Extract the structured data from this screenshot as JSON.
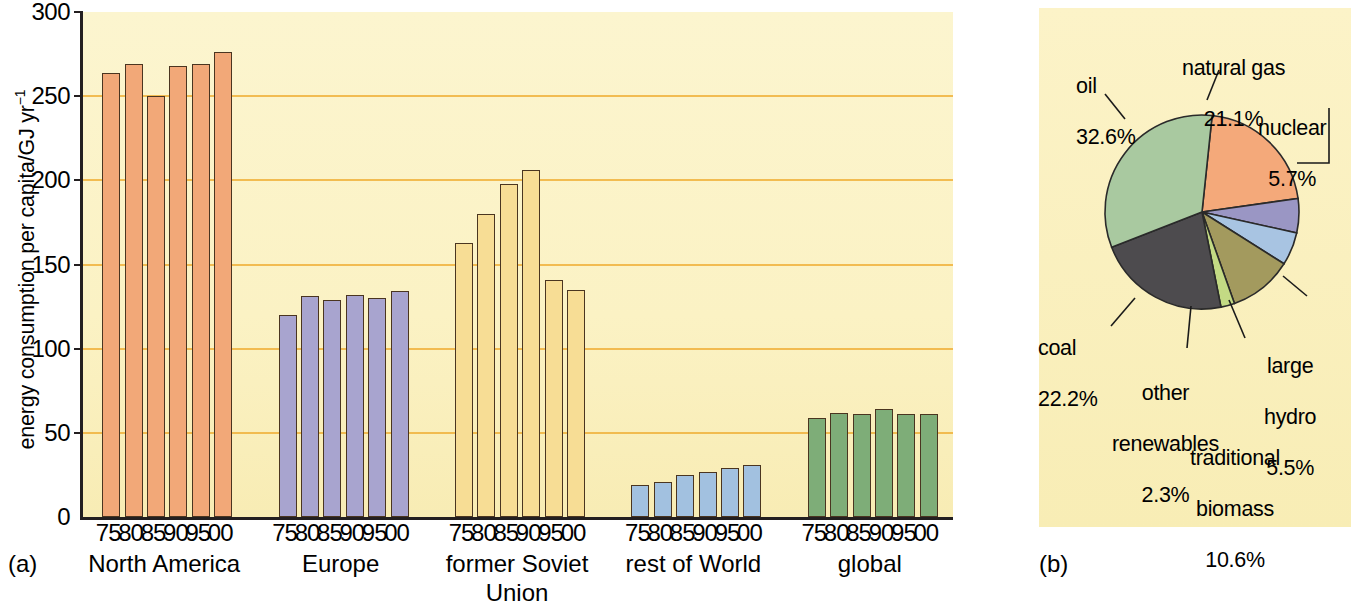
{
  "figure": {
    "panel_a_label": "(a)",
    "panel_b_label": "(b)"
  },
  "chart_data": [
    {
      "type": "bar",
      "title": "",
      "panel": "(a)",
      "xlabel": "",
      "ylabel": "energy consumption per capita/GJ yr-1",
      "ylabel_main": "energy consumption per capita/GJ yr",
      "ylabel_exponent": "−1",
      "ylim": [
        0,
        300
      ],
      "yticks": [
        "0",
        "50",
        "100",
        "150",
        "200",
        "250",
        "300"
      ],
      "ytick_values": [
        0,
        50,
        100,
        150,
        200,
        250,
        300
      ],
      "grid": "horizontal",
      "categories": [
        "75",
        "80",
        "85",
        "90",
        "95",
        "00"
      ],
      "groups": [
        {
          "name": "North America",
          "color": "#f2a878",
          "values": [
            264,
            269,
            250,
            268,
            269,
            276
          ]
        },
        {
          "name": "Europe",
          "color": "#a8a4cf",
          "values": [
            120,
            131,
            129,
            132,
            130,
            134
          ]
        },
        {
          "name": "former Soviet Union",
          "name_line1": "former Soviet",
          "name_line2": "Union",
          "color": "#f7dd95",
          "values": [
            163,
            180,
            198,
            206,
            141,
            135
          ]
        },
        {
          "name": "rest of World",
          "color": "#a2c1e0",
          "values": [
            19,
            21,
            25,
            27,
            29,
            31
          ]
        },
        {
          "name": "global",
          "color": "#7ead78",
          "values": [
            59,
            62,
            61,
            64,
            61,
            61
          ]
        }
      ]
    },
    {
      "type": "pie",
      "panel": "(b)",
      "title": "",
      "legend": "callout-labels",
      "slices": [
        {
          "label": "natural gas",
          "percent": 21.1,
          "percent_text": "21.1%",
          "color": "#f4a97a"
        },
        {
          "label": "nuclear",
          "percent": 5.7,
          "percent_text": "5.7%",
          "color": "#9a96c4"
        },
        {
          "label": "large hydro",
          "label_line1": "large",
          "label_line2": "hydro",
          "percent": 5.5,
          "percent_text": "5.5%",
          "color": "#a8c4e2"
        },
        {
          "label": "traditional biomass",
          "label_line1": "traditional",
          "label_line2": "biomass",
          "percent": 10.6,
          "percent_text": "10.6%",
          "color": "#a39a5e"
        },
        {
          "label": "other renewables",
          "label_line1": "other",
          "label_line2": "renewables",
          "percent": 2.3,
          "percent_text": "2.3%",
          "color": "#c3da84"
        },
        {
          "label": "coal",
          "percent": 22.2,
          "percent_text": "22.2%",
          "color": "#4d4b4e"
        },
        {
          "label": "oil",
          "percent": 32.6,
          "percent_text": "32.6%",
          "color": "#a9c9a0"
        }
      ]
    }
  ],
  "panel_a": {
    "ylabel_main": "energy consumption per capita/GJ yr",
    "ylabel_exponent": "−1"
  },
  "pie_labels": {
    "oil": {
      "name": "oil",
      "pct": "32.6%"
    },
    "natural_gas": {
      "name": "natural gas",
      "pct": "21.1%"
    },
    "nuclear": {
      "name": "nuclear",
      "pct": "5.7%"
    },
    "large_hydro": {
      "line1": "large",
      "line2": "hydro",
      "pct": "5.5%"
    },
    "traditional_biomass": {
      "line1": "traditional",
      "line2": "biomass",
      "pct": "10.6%"
    },
    "other_renewables": {
      "line1": "other",
      "line2": "renewables",
      "pct": "2.3%"
    },
    "coal": {
      "name": "coal",
      "pct": "22.2%"
    }
  }
}
